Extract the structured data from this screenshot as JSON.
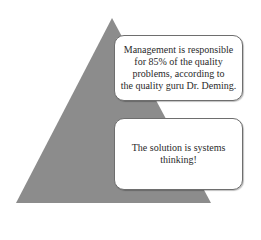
{
  "diagram": {
    "type": "pyramid-with-callouts",
    "pyramid_color": "#8c8c8c",
    "box_border_color": "#6e6e6e",
    "callouts": [
      {
        "lines": [
          "Management is responsible",
          "for 85% of the quality",
          "problems, according to",
          "the quality guru Dr. Deming."
        ]
      },
      {
        "lines": [
          "The solution is systems",
          "thinking!"
        ]
      }
    ]
  }
}
